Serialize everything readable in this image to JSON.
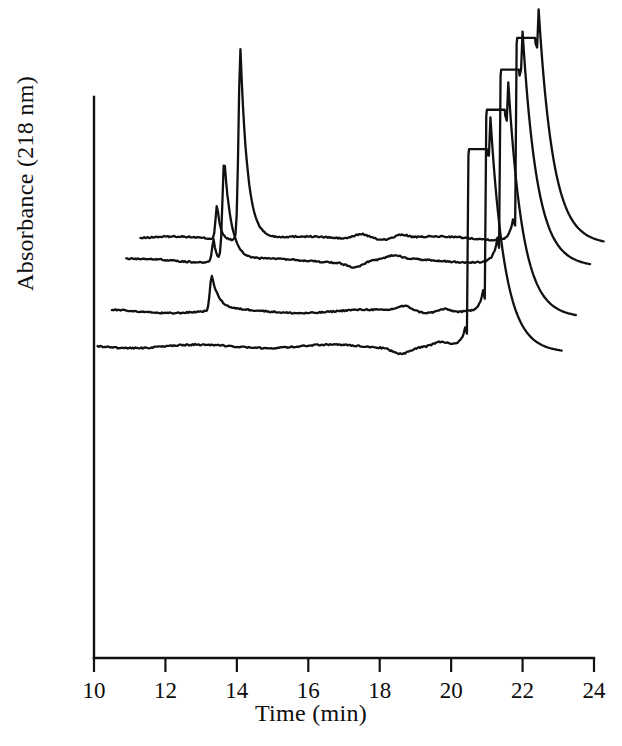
{
  "figure": {
    "kind": "chromatogram",
    "background_color": "#ffffff",
    "line_color": "#111111"
  },
  "axes": {
    "x_title": "Time (min)",
    "y_title": "Absorbance (218 nm)",
    "x_tick_labels": [
      "10",
      "12",
      "14",
      "16",
      "18",
      "20",
      "22",
      "24"
    ],
    "x_tick_values": [
      10,
      12,
      14,
      16,
      18,
      20,
      22,
      24
    ],
    "x_minor_tick_values": [
      11,
      13,
      15,
      17,
      19,
      21,
      23
    ],
    "y_tick_labels": [],
    "x_axis_line_color": "#111111",
    "y_axis_line_color": "#111111"
  },
  "chart_data": {
    "type": "line",
    "title": "",
    "subtitle": "",
    "xlabel": "Time (min)",
    "ylabel": "Absorbance (218 nm)",
    "xlim": [
      10,
      24
    ],
    "ylim": [
      0,
      1
    ],
    "grid": false,
    "legend": "none",
    "series": [
      {
        "name": "trace-4-top",
        "stack_index": 4,
        "baseline_level": 0.66,
        "start_time": 11.3,
        "end_time": 24.3,
        "analyte_peak": {
          "time": 14.1,
          "relative_height": 0.3,
          "shoulder_time": 13.45,
          "shoulder_relative_height": 0.055
        },
        "solvent_peak": {
          "rise_time": 21.75,
          "clipped": true,
          "clip_top": 0.975,
          "fall_time": 22.45
        },
        "baseline_ripple_time": 17.5
      },
      {
        "name": "trace-3",
        "stack_index": 3,
        "baseline_level": 0.625,
        "start_time": 10.9,
        "end_time": 23.9,
        "analyte_peak": {
          "time": 13.65,
          "relative_height": 0.16,
          "shoulder_time": 13.35,
          "shoulder_relative_height": 0.035
        },
        "solvent_peak": {
          "rise_time": 21.3,
          "clipped": true,
          "clip_top": 0.925,
          "fall_time": 22.0
        },
        "baseline_ripple_time": 17.3
      },
      {
        "name": "trace-2",
        "stack_index": 2,
        "baseline_level": 0.545,
        "start_time": 10.5,
        "end_time": 23.5,
        "analyte_peak": {
          "time": 13.3,
          "relative_height": 0.055,
          "shoulder_time": null,
          "shoulder_relative_height": 0
        },
        "solvent_peak": {
          "rise_time": 20.9,
          "clipped": true,
          "clip_top": 0.862,
          "fall_time": 21.6
        },
        "baseline_ripple_time": 18.7
      },
      {
        "name": "trace-1-bottom",
        "stack_index": 1,
        "baseline_level": 0.49,
        "start_time": 10.1,
        "end_time": 23.1,
        "analyte_peak": {
          "time": null,
          "relative_height": 0,
          "shoulder_time": null,
          "shoulder_relative_height": 0
        },
        "solvent_peak": {
          "rise_time": 20.4,
          "clipped": true,
          "clip_top": 0.8,
          "fall_time": 21.1
        },
        "baseline_ripple_time": 18.6
      }
    ]
  }
}
